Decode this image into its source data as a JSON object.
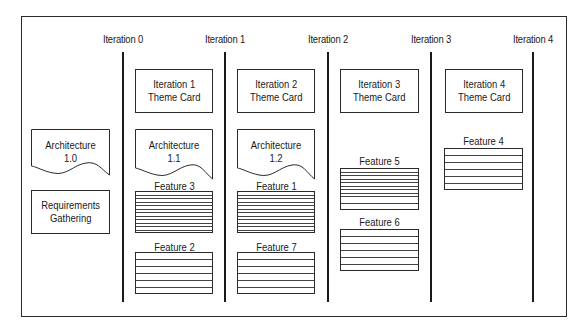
{
  "diagram": {
    "iterations": [
      {
        "label": "Iteration 0",
        "x": 123
      },
      {
        "label": "Iteration 1",
        "x": 225
      },
      {
        "label": "Iteration 2",
        "x": 328
      },
      {
        "label": "Iteration 3",
        "x": 431
      },
      {
        "label": "Iteration 4",
        "x": 533
      }
    ],
    "pre_iteration": {
      "architecture": {
        "line1": "Architecture",
        "line2": "1.0"
      },
      "requirements": {
        "line1": "Requirements",
        "line2": "Gathering"
      }
    },
    "columns": [
      {
        "theme_card": {
          "line1": "Iteration 1",
          "line2": "Theme Card"
        },
        "architecture": {
          "line1": "Architecture",
          "line2": "1.1"
        },
        "features": [
          "Feature 3",
          "Feature 2"
        ]
      },
      {
        "theme_card": {
          "line1": "Iteration 2",
          "line2": "Theme Card"
        },
        "architecture": {
          "line1": "Architecture",
          "line2": "1.2"
        },
        "features": [
          "Feature 1",
          "Feature 7"
        ]
      },
      {
        "theme_card": {
          "line1": "Iteration 3",
          "line2": "Theme Card"
        },
        "features": [
          "Feature 5",
          "Feature 6"
        ]
      },
      {
        "theme_card": {
          "line1": "Iteration 4",
          "line2": "Theme Card"
        },
        "features": [
          "Feature 4"
        ]
      }
    ]
  }
}
